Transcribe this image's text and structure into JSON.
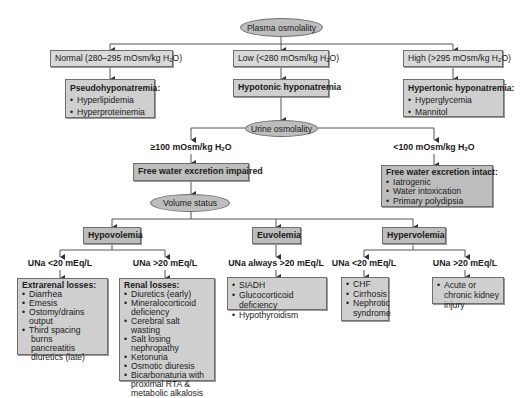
{
  "diagram": {
    "type": "flowchart",
    "topic": "Hyponatremia diagnostic algorithm",
    "root": {
      "label": "Plasma osmolality"
    },
    "plasma_branches": [
      {
        "label": "Normal (280–295 mOsm/kg H",
        "unit_sub": "2",
        "unit_tail": "O)",
        "result": {
          "title": "Pseudohyponatremia:",
          "items": [
            "Hyperlipidemia",
            "Hyperproteinemia"
          ]
        }
      },
      {
        "label": "Low (<280 mOsm/kg H",
        "unit_sub": "2",
        "unit_tail": "O)",
        "result": {
          "title": "Hypotonic hyponatremia",
          "items": []
        }
      },
      {
        "label": "High (>295 mOsm/kg H",
        "unit_sub": "2",
        "unit_tail": "O)",
        "result": {
          "title": "Hypertonic hyponatremia:",
          "items": [
            "Hyperglycemia",
            "Mannitol"
          ]
        }
      }
    ],
    "urine_node": {
      "label": "Urine osmolality"
    },
    "urine_branches": [
      {
        "label": "≥100 mOsm/kg H",
        "unit_sub": "2",
        "unit_tail": "O",
        "result": {
          "title": "Free water excretion impaired",
          "items": []
        }
      },
      {
        "label": "<100 mOsm/kg H",
        "unit_sub": "2",
        "unit_tail": "O",
        "result": {
          "title": "Free water excretion intact:",
          "items": [
            "Iatrogenic",
            "Water intoxication",
            "Primary polydipsia"
          ]
        }
      }
    ],
    "volume_node": {
      "label": "Volume status"
    },
    "volume_branches": [
      {
        "label": "Hypovolemia",
        "sub": [
          {
            "label": "UNa <20 mEq/L",
            "result": {
              "title": "Extrarenal losses:",
              "items": [
                "Diarrhea",
                "Emesis",
                "Ostomy/drains output",
                "Third spacing burns pancreatitis diuretics (late)"
              ],
              "items_display": [
                "Diarrhea",
                "Emesis",
                "Ostomy/drains output",
                "Third spacing"
              ],
              "continuation": [
                "burns",
                "pancreatitis",
                "diuretics (late)"
              ]
            }
          },
          {
            "label": "UNa >20 mEq/L",
            "result": {
              "title": "Renal losses:",
              "items": [
                "Diuretics (early)",
                "Mineralocorticoid deficiency",
                "Cerebral salt wasting",
                "Salt losing nephropathy",
                "Ketonuria",
                "Osmotic diuresis",
                "Bicarbonaturia with proximal RTA & metabolic alkalosis"
              ]
            }
          }
        ]
      },
      {
        "label": "Euvolemia",
        "sub": [
          {
            "label": "UNa always >20 mEq/L",
            "result": {
              "title": "",
              "items": [
                "SIADH",
                "Glucocorticoid deficiency",
                "Hypothyroidism"
              ]
            }
          }
        ]
      },
      {
        "label": "Hypervolemia",
        "sub": [
          {
            "label": "UNa <20 mEq/L",
            "result": {
              "title": "",
              "items": [
                "CHF",
                "Cirrhosis",
                "Nephrotic syndrome"
              ]
            }
          },
          {
            "label": "UNa >20 mEq/L",
            "result": {
              "title": "",
              "items": [
                "Acute or chronic kidney injury"
              ]
            }
          }
        ]
      }
    ]
  },
  "colors": {
    "box_fill": "#cfcfcf",
    "ellipse_fill": "#bdbdbd",
    "border": "#6f6f6f",
    "line": "#555555"
  }
}
